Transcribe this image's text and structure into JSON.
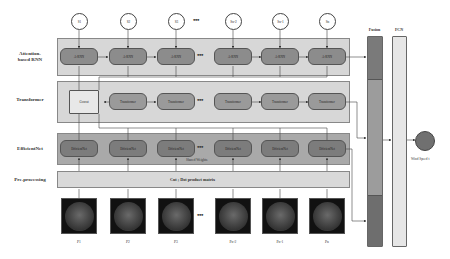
{
  "row_labels": {
    "rnn": "Attention-\nbased RNN",
    "rnn_line1": "Attention-",
    "rnn_line2": "based RNN",
    "transformer": "Transformer",
    "efficientnet": "EfficientNet",
    "preprocessing": "Pre-processing"
  },
  "inputs_s": [
    "S1",
    "S2",
    "S3",
    "Sn-2",
    "Sn-1",
    "Sn"
  ],
  "inputs_p": [
    "P1",
    "P2",
    "P3",
    "Pn-2",
    "Pn-1",
    "Pn"
  ],
  "ellipsis": "•••",
  "rnn_nodes": [
    "A-RNN",
    "A-RNN",
    "A-RNN",
    "A-RNN",
    "A-RNN",
    "A-RNN"
  ],
  "transformer": {
    "concat": "Concat",
    "nodes": [
      "Transformer",
      "Transformer",
      "Transformer",
      "Transformer",
      "Transformer"
    ]
  },
  "efficientnet": {
    "nodes": [
      "EfficientNet",
      "EfficientNet",
      "EfficientNet",
      "EfficientNet",
      "EfficientNet",
      "EfficientNet"
    ],
    "shared_weights": "Shared Weights"
  },
  "preprocessing": {
    "text": "Cut ;  Dot product matrix"
  },
  "fusion": {
    "label": "Fusion"
  },
  "fcn": {
    "label": "FCN"
  },
  "output": {
    "label": "Wind Speed t"
  },
  "colors": {
    "panel_light": "#d7d7d7",
    "panel_mid": "#a9a9a9",
    "node_dark": "#7c7c7c",
    "fusion_dark": "#6e6e6e",
    "fusion_mid": "#9c9c9c",
    "fcn": "#e6e6e6"
  }
}
